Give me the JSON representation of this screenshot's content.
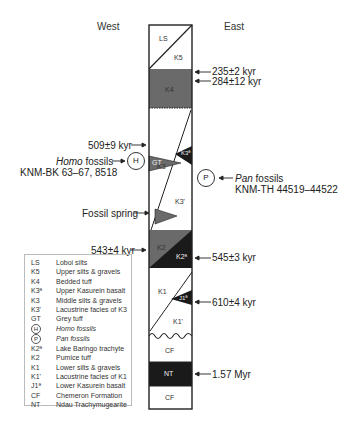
{
  "headers": {
    "west": "West",
    "east": "East"
  },
  "units_in_column": {
    "LS": "LS",
    "K5": "K5",
    "K4": "K4",
    "GT": "GT",
    "K3a": "K3ª",
    "K3": "K3",
    "K3prime": "K3'",
    "K2": "K2",
    "K2a": "K2ª",
    "K1": "K1",
    "J1a": "J1ª",
    "K1prime": "K1'",
    "CF_upper": "CF",
    "NT": "NT",
    "CF_lower": "CF"
  },
  "annotations": {
    "east": [
      {
        "text": "235±2 kyr"
      },
      {
        "text": "284±12 kyr"
      },
      {
        "text": "545±3 kyr"
      },
      {
        "text": "610±4 kyr"
      },
      {
        "text": "1.57 Myr"
      }
    ],
    "west": [
      {
        "text": "509±9 kyr"
      },
      {
        "text": "543±4 kyr"
      },
      {
        "text": "Fossil spring"
      }
    ],
    "homo": {
      "symbol": "H",
      "label_italic": "Homo",
      "label_rest": " fossils",
      "specimens": "KNM-BK 63–67, 8518"
    },
    "pan": {
      "symbol": "P",
      "label_italic": "Pan",
      "label_rest": " fossils",
      "specimens": "KNM-TH 44519–44522"
    }
  },
  "legend": [
    {
      "code": "LS",
      "desc": "Loboi silts"
    },
    {
      "code": "K5",
      "desc": "Upper silts & gravels"
    },
    {
      "code": "K4",
      "desc": "Bedded tuff"
    },
    {
      "code": "K3ª",
      "desc": "Upper Kasurein basalt"
    },
    {
      "code": "K3",
      "desc": "Middle silts & gravels"
    },
    {
      "code": "K3'",
      "desc": "Lacustrine facies of K3"
    },
    {
      "code": "GT",
      "desc": "Grey tuff"
    },
    {
      "code": "H",
      "desc": "Homo fossils",
      "circle": true,
      "italic": true
    },
    {
      "code": "P",
      "desc": "Pan fossils",
      "circle": true,
      "italic": true
    },
    {
      "code": "K2ª",
      "desc": "Lake Baringo trachyte"
    },
    {
      "code": "K2",
      "desc": "Pumice tuff"
    },
    {
      "code": "K1",
      "desc": "Lower silts & gravels"
    },
    {
      "code": "K1'",
      "desc": "Lacustrine facies of K1"
    },
    {
      "code": "J1ª",
      "desc": "Lower Kasurein basalt"
    },
    {
      "code": "CF",
      "desc": "Chemeron Formation"
    },
    {
      "code": "NT",
      "desc": "Ndau Trachymugearite"
    }
  ],
  "colors": {
    "tuff_gray": "#6a6a6a",
    "basalt_black": "#1a1a1a",
    "line": "#222222"
  }
}
